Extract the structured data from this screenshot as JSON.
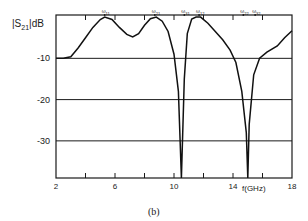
{
  "chart_data": {
    "type": "line",
    "title": "",
    "caption": "(b)",
    "xlabel": "f(GHz)",
    "ylabel": "|S21|dB",
    "ylabel_main": "|S",
    "ylabel_sub": "21",
    "ylabel_unit": "|dB",
    "xlim": [
      2,
      18
    ],
    "ylim": [
      -39,
      0
    ],
    "x_ticks": [
      2,
      4,
      6,
      8,
      10,
      12,
      14,
      16,
      18
    ],
    "x_tick_labels": [
      "2",
      "6",
      "10",
      "14",
      "18"
    ],
    "x_tick_label_values": [
      2,
      6,
      10,
      14,
      18
    ],
    "y_ticks": [
      -10,
      -20,
      -30
    ],
    "y_tick_labels": [
      "-10",
      "-20",
      "-30"
    ],
    "grid": "horizontal lines at -10, -20, -30 dB",
    "top_markers": [
      {
        "label": "ω",
        "sub": "11",
        "x": 5.3
      },
      {
        "label": "ω",
        "sub": "21",
        "x": 8.7
      },
      {
        "label": "ω",
        "sub": "31",
        "x": 10.7
      },
      {
        "label": "ω",
        "sub": "12",
        "x": 11.7
      },
      {
        "label": "ω",
        "sub": "22",
        "x": 14.7
      },
      {
        "label": "ω",
        "sub": "32",
        "x": 15.5
      }
    ],
    "series": [
      {
        "name": "|S21| (dB)",
        "x": [
          2.0,
          2.5,
          3.0,
          3.5,
          4.0,
          4.5,
          5.0,
          5.3,
          5.8,
          6.3,
          6.8,
          7.2,
          7.6,
          8.0,
          8.4,
          8.8,
          9.2,
          9.6,
          10.0,
          10.3,
          10.5,
          10.7,
          10.9,
          11.2,
          11.5,
          11.8,
          12.3,
          12.8,
          13.3,
          13.8,
          14.2,
          14.6,
          14.9,
          15.0,
          15.1,
          15.4,
          15.8,
          16.3,
          17.0,
          17.5,
          18.0
        ],
        "y": [
          -10.0,
          -10.0,
          -9.6,
          -7.5,
          -5.0,
          -2.5,
          -0.6,
          0.0,
          -0.6,
          -2.5,
          -4.2,
          -4.8,
          -4.0,
          -2.0,
          -0.4,
          0.0,
          -1.0,
          -3.5,
          -9.0,
          -18.0,
          -39.0,
          -15.0,
          -4.0,
          -0.5,
          0.0,
          0.0,
          -1.5,
          -3.5,
          -5.5,
          -8.0,
          -11.0,
          -18.0,
          -28.0,
          -39.0,
          -26.0,
          -14.0,
          -10.0,
          -8.5,
          -7.0,
          -5.0,
          -3.3
        ]
      }
    ]
  }
}
